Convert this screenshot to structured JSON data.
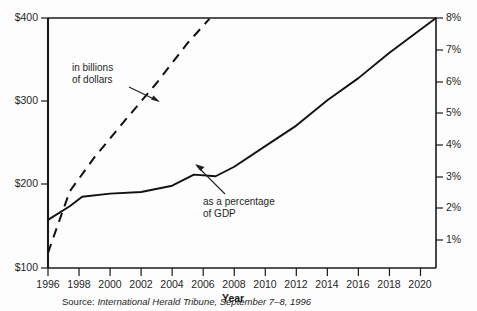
{
  "chart_data": {
    "type": "line",
    "title": "",
    "xlabel": "Year",
    "ylabel_left": "",
    "ylabel_right": "",
    "grid": false,
    "legend_position": "none",
    "xlim": [
      1996,
      2021
    ],
    "x_ticks": [
      "1996",
      "1998",
      "2000",
      "2002",
      "2004",
      "2006",
      "2008",
      "2010",
      "2012",
      "2014",
      "2016",
      "2018",
      "2020"
    ],
    "x_tick_values": [
      1996,
      1998,
      2000,
      2002,
      2004,
      2006,
      2008,
      2010,
      2012,
      2014,
      2016,
      2018,
      2020
    ],
    "y_left_ticks": [
      "$100",
      "$200",
      "$300",
      "$400"
    ],
    "y_left_values": [
      100,
      200,
      300,
      400
    ],
    "ylim_left": [
      100,
      400
    ],
    "y_right_ticks": [
      "1%",
      "2%",
      "3%",
      "4%",
      "5%",
      "6%",
      "7%",
      "8%"
    ],
    "y_right_values": [
      1,
      2,
      3,
      4,
      5,
      6,
      7,
      8
    ],
    "ylim_right": [
      0.1,
      8.0
    ],
    "series": [
      {
        "name": "in billions of dollars",
        "style": "dashed",
        "axis": "left",
        "units": "billions of dollars",
        "x": [
          1996.0,
          1996.6,
          1997.4,
          1999.0,
          2001.0,
          2003.0,
          2005.0,
          2006.4
        ],
        "values": [
          118,
          150,
          192,
          233,
          278,
          322,
          370,
          399
        ]
      },
      {
        "name": "as a percentage of GDP",
        "style": "solid",
        "axis": "right",
        "units": "percent of GDP",
        "x": [
          1996.0,
          1997.4,
          1998.2,
          2000.0,
          2002.0,
          2004.0,
          2005.4,
          2006.8,
          2008.0,
          2010.0,
          2012.0,
          2014.0,
          2016.0,
          2018.0,
          2021.0
        ],
        "values": [
          1.62,
          2.05,
          2.35,
          2.45,
          2.5,
          2.7,
          3.05,
          3.0,
          3.3,
          3.95,
          4.6,
          5.4,
          6.1,
          6.9,
          8.0
        ]
      }
    ],
    "annotations": [
      {
        "id": "billions-annotation",
        "line1": "in billions",
        "line2": "of dollars",
        "text": "in billions of dollars",
        "points_to_series": "in billions of dollars"
      },
      {
        "id": "gdp-annotation",
        "line1": "as a percentage",
        "line2": "of GDP",
        "text": "as a percentage of GDP",
        "points_to_series": "as a percentage of GDP"
      }
    ],
    "source": {
      "label": "Source:",
      "publication": "International Herald Tribune,",
      "date": "September 7–8, 1996",
      "full": "Source: International Herald Tribune, September 7–8, 1996"
    },
    "colors": {
      "line": "#111111",
      "axis": "#1a1a1a",
      "text": "#1f1f1f",
      "background": "#fdfdfd"
    }
  }
}
